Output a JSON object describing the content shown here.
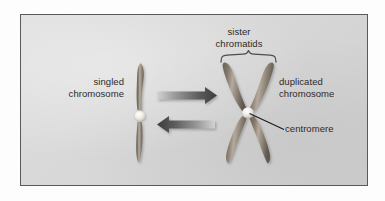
{
  "figure": {
    "background_color": "#ffffff",
    "panel_background_color": "#d8d8d8",
    "panel_border_color": "#5a5a5c"
  },
  "labels": {
    "singled_chromosome": "singled\nchromosome",
    "singled_chromosome_line1": "singled",
    "singled_chromosome_line2": "chromosome",
    "sister_chromatids_line1": "sister",
    "sister_chromatids_line2": "chromatids",
    "duplicated_chromosome_line1": "duplicated",
    "duplicated_chromosome_line2": "chromosome",
    "centromere": "centromere"
  },
  "diagram": {
    "single_chromosome": {
      "name": "singled chromosome",
      "shape": "single rod",
      "arm_color": "#7d7265",
      "highlight_color": "#b9b0a4",
      "centromere_color": "#f4f2ee",
      "centromere_x": 140,
      "centromere_y": 116,
      "top_y": 62,
      "bottom_y": 163
    },
    "duplicated_chromosome": {
      "name": "duplicated chromosome",
      "shape": "X, two sister chromatids",
      "arm_color": "#7d7265",
      "highlight_color": "#b9b0a4",
      "centromere_color": "#f4f2ee",
      "centromere_x": 248,
      "centromere_y": 112,
      "chromatid_count": 2,
      "arm_count": 4
    },
    "arrows": [
      {
        "name": "forward-arrow",
        "direction": "right",
        "meaning": "duplication",
        "x1": 156,
        "y1": 95,
        "x2": 216,
        "y2": 95,
        "color_start": "#c9c9c9",
        "color_end": "#4a4a4a"
      },
      {
        "name": "reverse-arrow",
        "direction": "left",
        "meaning": "separation",
        "x1": 216,
        "y1": 124,
        "x2": 156,
        "y2": 124,
        "color_start": "#c9c9c9",
        "color_end": "#4a4a4a"
      }
    ],
    "brace": {
      "name": "sister-chromatids-brace",
      "left_x": 221,
      "right_x": 276,
      "y": 62,
      "color": "#4d4d4d"
    },
    "leader_line": {
      "name": "centromere-leader-line",
      "from_x": 249,
      "from_y": 113,
      "to_x": 284,
      "to_y": 129,
      "color": "#1e1e1e"
    }
  }
}
